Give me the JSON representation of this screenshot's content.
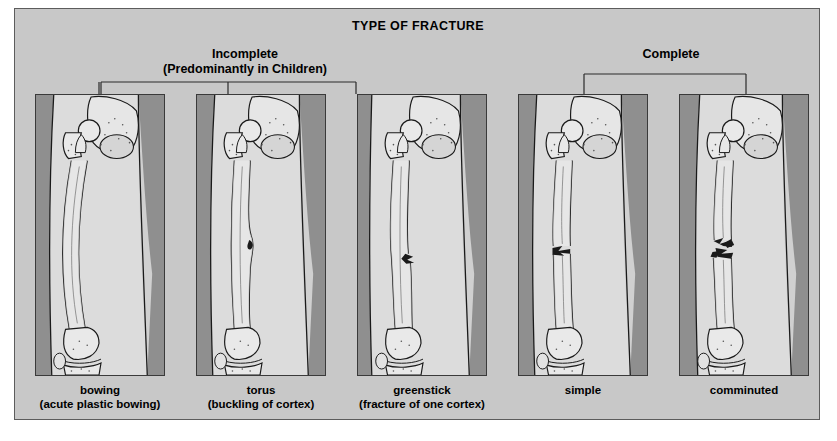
{
  "figure": {
    "title": "TYPE OF FRACTURE",
    "background_color": "#c8c8c8",
    "border_color": "#5c5c5c"
  },
  "groups": [
    {
      "id": "incomplete",
      "label_line1": "Incomplete",
      "label_line2": "(Predominantly in Children)",
      "member_panels": [
        "bowing",
        "torus",
        "greenstick"
      ]
    },
    {
      "id": "complete",
      "label_line1": "Complete",
      "label_line2": "",
      "member_panels": [
        "simple",
        "comminuted"
      ]
    }
  ],
  "panels": [
    {
      "id": "bowing",
      "caption": "bowing",
      "caption_sub": "(acute plastic bowing)",
      "anatomy": "femur with hip joint above and knee joint below",
      "finding": "shaft curved / bowed without discrete fracture line"
    },
    {
      "id": "torus",
      "caption": "torus",
      "caption_sub": "(buckling of cortex)",
      "anatomy": "femur with hip joint above and knee joint below",
      "finding": "focal buckle bulge of the cortex at mid shaft"
    },
    {
      "id": "greenstick",
      "caption": "greenstick",
      "caption_sub": "(fracture of one cortex)",
      "anatomy": "femur with hip joint above and knee joint below",
      "finding": "break of one cortex only, opposite cortex intact"
    },
    {
      "id": "simple",
      "caption": "simple",
      "caption_sub": "",
      "anatomy": "femur with hip joint above and knee joint below",
      "finding": "single transverse fracture line through both cortices"
    },
    {
      "id": "comminuted",
      "caption": "comminuted",
      "caption_sub": "",
      "anatomy": "femur with hip joint above and knee joint below",
      "finding": "fracture with multiple bone fragments"
    }
  ],
  "colors": {
    "panel_background": "#d0d0d0",
    "soft_tissue": "#dcdcdc",
    "bone_fill": "#e6e6e6",
    "shadow_gray": "#8f8f8f",
    "line": "#1a1a1a"
  }
}
